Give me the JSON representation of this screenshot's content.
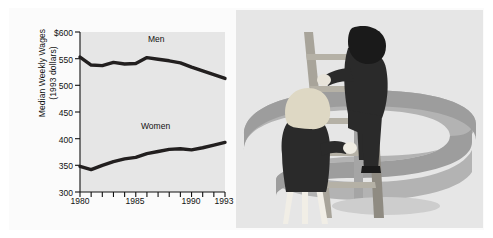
{
  "figure": {
    "background_color": "#ffffff",
    "panel_color": "#fbfbfb"
  },
  "chart_data": {
    "type": "line",
    "title": "",
    "xlabel": "",
    "ylabel": "Median Weekly Wages (1993 dollars)",
    "ylabel_line1": "Median Weekly Wages",
    "ylabel_line2": "(1993 dollars)",
    "ylim": [
      300,
      600
    ],
    "xlim": [
      1980,
      1993
    ],
    "ytick_labels": [
      "$600",
      "550",
      "500",
      "450",
      "400",
      "350",
      "300"
    ],
    "ytick_values": [
      600,
      550,
      500,
      450,
      400,
      350,
      300
    ],
    "xtick_labels": [
      "1980",
      "1985",
      "1990",
      "1993"
    ],
    "xtick_values": [
      1980,
      1985,
      1990,
      1993
    ],
    "x": [
      1980,
      1981,
      1982,
      1983,
      1984,
      1985,
      1986,
      1987,
      1988,
      1989,
      1990,
      1991,
      1992,
      1993
    ],
    "grid": false,
    "legend": "inline-labels",
    "plot_background": "#e6e6e6",
    "line_color": "#221f1f",
    "series": [
      {
        "name": "Men",
        "label": "Men",
        "values": [
          553,
          538,
          537,
          543,
          540,
          541,
          552,
          549,
          546,
          542,
          534,
          527,
          520,
          513
        ]
      },
      {
        "name": "Women",
        "label": "Women",
        "values": [
          348,
          342,
          350,
          357,
          362,
          365,
          372,
          376,
          380,
          381,
          379,
          383,
          388,
          393
        ]
      }
    ]
  },
  "illustration": {
    "name": "dollar-sign-ladder-illustration",
    "dollar_sign_color": "#9d9d9d",
    "dollar_sign_shadow_color": "#b8b8b8",
    "background_color": "#e6e6e6",
    "ladder_color": "#a8a49a",
    "ladder_shadow_color": "#8f8b82",
    "man": {
      "name": "man-climbing-ladder",
      "hair_color": "#1a1a1a",
      "body_color": "#2a2a2a",
      "skin_color": "#e8e4da"
    },
    "woman": {
      "name": "woman-at-ladder-base",
      "hair_color": "#ded8c4",
      "body_color": "#2a2a2a",
      "skin_color": "#efece3"
    }
  }
}
